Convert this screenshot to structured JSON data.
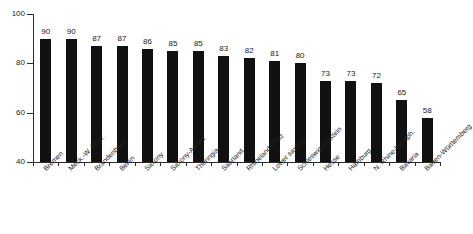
{
  "chart_data": {
    "type": "bar",
    "title": "",
    "subtitle": "",
    "xlabel": "",
    "ylabel": "",
    "ylim": [
      40,
      100
    ],
    "yticks": [
      40,
      60,
      80,
      100
    ],
    "grid": false,
    "legend": "none",
    "bar_color": "#111111",
    "axis_color": "#2b2b2b",
    "background_color": "#ffffff",
    "label_rotation_deg": -45,
    "categories": [
      "Bremen",
      "Meck.-W. Pom.",
      "Brandenburg",
      "Berlin",
      "Saxony",
      "Saxony-Anhalt",
      "Thuringia",
      "Saarland",
      "Rhineland-Pfalz",
      "Lower saxony",
      "Schleswig-Holstein",
      "Hesse",
      "Hamburg",
      "N. Rhine-Westph.",
      "Bavaria",
      "Baden-Württemberg"
    ],
    "values": [
      90,
      90,
      87,
      87,
      86,
      85,
      85,
      83,
      82,
      81,
      80,
      73,
      73,
      72,
      65,
      58
    ],
    "value_labels": [
      "90",
      "90",
      "87",
      "87",
      "86",
      "85",
      "85",
      "83",
      "82",
      "81",
      "80",
      "73",
      "73",
      "72",
      "65",
      "58"
    ],
    "ytick_labels": [
      "40",
      "60",
      "80",
      "100"
    ]
  }
}
